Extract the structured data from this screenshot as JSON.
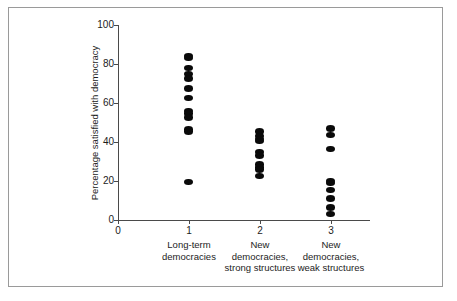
{
  "figure": {
    "border_color": "#9a9a9a",
    "background": "#ffffff",
    "dot_color": "#0a0a0a",
    "axis_color": "#4a4a4a"
  },
  "chart_data": {
    "type": "scatter",
    "title": "",
    "subtitle": "",
    "xlabel": "",
    "ylabel": "Percentage satisfied with democracy",
    "xlim": [
      0,
      3.55
    ],
    "ylim": [
      0,
      100
    ],
    "grid": false,
    "legend": null,
    "x_tick_labels": [
      "0",
      "1",
      "2",
      "3"
    ],
    "x_tick_values": [
      0,
      1,
      2,
      3
    ],
    "y_tick_labels": [
      "0",
      "20",
      "40",
      "60",
      "80",
      "100"
    ],
    "y_tick_values": [
      0,
      20,
      40,
      60,
      80,
      100
    ],
    "categories": [
      {
        "x": 1,
        "tick_label": "1",
        "label_lines": [
          "Long-term",
          "democracies"
        ],
        "values": [
          84.0,
          83.0,
          78.0,
          75.0,
          72.5,
          67.5,
          62.5,
          56.0,
          54.5,
          52.5,
          46.5,
          45.5,
          19.5
        ]
      },
      {
        "x": 2,
        "tick_label": "2",
        "label_lines": [
          "New",
          "democracies,",
          "strong structures"
        ],
        "values": [
          45.5,
          43.0,
          41.5,
          40.5,
          35.0,
          33.0,
          28.5,
          27.0,
          26.0,
          22.5
        ]
      },
      {
        "x": 3,
        "tick_label": "3",
        "label_lines": [
          "New",
          "democracies,",
          "weak structures"
        ],
        "values": [
          47.0,
          43.5,
          36.5,
          20.0,
          19.0,
          15.5,
          11.0,
          6.5,
          3.0
        ]
      }
    ]
  }
}
